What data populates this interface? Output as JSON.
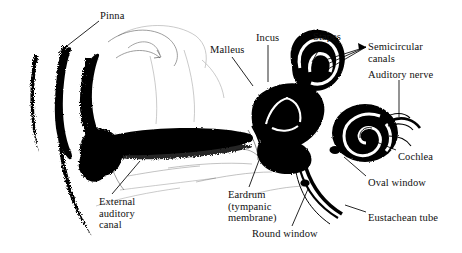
{
  "figure": {
    "background_color": "#ffffff",
    "ink_color": "#000000",
    "width": 462,
    "height": 253
  },
  "labels": [
    {
      "id": "pinna",
      "text": "Pinna",
      "x": 100,
      "y": 10
    },
    {
      "id": "malleus",
      "text": "Malleus",
      "x": 210,
      "y": 44
    },
    {
      "id": "incus",
      "text": "Incus",
      "x": 256,
      "y": 32
    },
    {
      "id": "stapes",
      "text": "Stapes",
      "x": 313,
      "y": 31
    },
    {
      "id": "semicircular-canals",
      "text": "Semicircular\ncanals",
      "x": 368,
      "y": 41
    },
    {
      "id": "auditory-nerve",
      "text": "Auditory nerve",
      "x": 368,
      "y": 69
    },
    {
      "id": "cochlea",
      "text": "Cochlea",
      "x": 398,
      "y": 151
    },
    {
      "id": "oval-window",
      "text": "Oval window",
      "x": 368,
      "y": 177
    },
    {
      "id": "eustachean-tube",
      "text": "Eustachean tube",
      "x": 368,
      "y": 212
    },
    {
      "id": "external-auditory-canal",
      "text": "External\nauditory\ncanal",
      "x": 99,
      "y": 196
    },
    {
      "id": "eardrum",
      "text": "Eardrum\n(tympanic\nmembrane)",
      "x": 228,
      "y": 189
    },
    {
      "id": "round-window",
      "text": "Round window",
      "x": 252,
      "y": 228
    }
  ],
  "leader_lines": [
    {
      "id": "pinna-leader",
      "from": [
        99,
        21
      ],
      "to": [
        58,
        53
      ]
    },
    {
      "id": "malleus-leader",
      "from": [
        232,
        57
      ],
      "to": [
        253,
        86
      ]
    },
    {
      "id": "incus-leader",
      "from": [
        268,
        45
      ],
      "to": [
        268,
        82
      ]
    },
    {
      "id": "stapes-leader",
      "from": [
        322,
        44
      ],
      "to": [
        312,
        62
      ]
    },
    {
      "id": "semicircular-leader-1",
      "from": [
        366,
        47
      ],
      "to": [
        322,
        61
      ]
    },
    {
      "id": "semicircular-leader-2",
      "from": [
        366,
        47
      ],
      "to": [
        318,
        68
      ]
    },
    {
      "id": "semicircular-leader-3",
      "from": [
        366,
        47
      ],
      "to": [
        316,
        76
      ]
    },
    {
      "id": "auditory-nerve-leader",
      "from": [
        399,
        80
      ],
      "to": [
        399,
        117
      ]
    },
    {
      "id": "cochlea-leader",
      "from": [
        396,
        150
      ],
      "to": [
        374,
        141
      ]
    },
    {
      "id": "oval-window-leader",
      "from": [
        366,
        176
      ],
      "to": [
        344,
        157
      ]
    },
    {
      "id": "eustachean-leader",
      "from": [
        366,
        212
      ],
      "to": [
        345,
        205
      ]
    },
    {
      "id": "external-canal-leader",
      "from": [
        112,
        194
      ],
      "to": [
        140,
        161
      ]
    },
    {
      "id": "eardrum-leader",
      "from": [
        249,
        187
      ],
      "to": [
        261,
        155
      ]
    },
    {
      "id": "round-window-leader",
      "from": [
        292,
        226
      ],
      "to": [
        308,
        189
      ]
    }
  ],
  "anatomy_parts": [
    {
      "id": "pinna-outer-ear",
      "name": "pinna (outer ear)"
    },
    {
      "id": "ear-canal",
      "name": "external auditory canal"
    },
    {
      "id": "eardrum",
      "name": "tympanic membrane"
    },
    {
      "id": "ossicles",
      "name": "malleus, incus, stapes"
    },
    {
      "id": "semicircular",
      "name": "semicircular canals"
    },
    {
      "id": "cochlea",
      "name": "cochlea"
    },
    {
      "id": "eustachian-tube",
      "name": "eustachian tube"
    }
  ]
}
